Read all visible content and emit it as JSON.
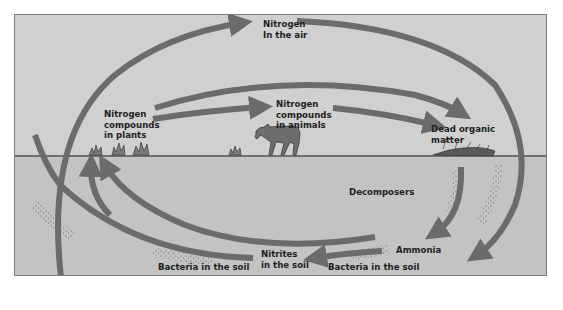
{
  "colors": {
    "sky": "#d0d0d0",
    "soil": "#c3c3c3",
    "arrow": "#6b6b6b",
    "ground_line": "#6f6f6f",
    "text": "#1e1e1e",
    "frame_border": "#7a7a7a"
  },
  "labels": {
    "air": {
      "line1": "Nitrogen",
      "line2": "In the air"
    },
    "plants": {
      "line1": "Nitrogen",
      "line2": "compounds",
      "line3": "in plants"
    },
    "animals": {
      "line1": "Nitrogen",
      "line2": "compounds",
      "line3": "in animals"
    },
    "dead_matter": {
      "line1": "Dead organic",
      "line2": "matter"
    },
    "decomposers": "Decomposers",
    "ammonia": "Ammonia",
    "nitrites": {
      "line1": "Nitrites",
      "line2": "in the soil"
    },
    "bacteria_left": "Bacteria in the soil",
    "bacteria_right": "Bacteria in the soil"
  },
  "illustrations": [
    "grass-tufts",
    "cow",
    "dead-organic-debris",
    "bacteria-speckles"
  ]
}
